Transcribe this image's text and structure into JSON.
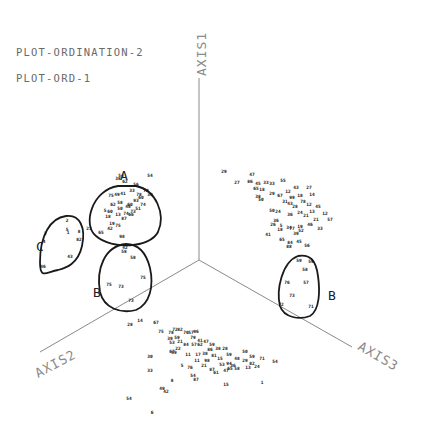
{
  "titles": {
    "line1": "PLOT-ORDINATION-2",
    "line2": "PLOT-ORD-1"
  },
  "axes": {
    "origin": [
      199,
      260
    ],
    "axis1": {
      "label": "AXIS1",
      "end": [
        199,
        78
      ]
    },
    "axis2": {
      "label": "AXIS2",
      "end": [
        40,
        352
      ]
    },
    "axis3": {
      "label": "AXIS3",
      "end": [
        352,
        347
      ]
    }
  },
  "clusters": [
    {
      "id": "A",
      "label": "A",
      "label_pos": [
        120,
        180
      ],
      "shape": "M118,186 C92,190 82,225 96,236 C112,250 150,248 158,232 C166,214 156,190 136,186 Z"
    },
    {
      "id": "B-left",
      "label": "B",
      "label_pos": [
        93,
        297
      ],
      "shape": "M126,244 C104,246 96,270 100,292 C104,308 120,314 136,310 C150,304 154,286 150,268 C146,252 138,244 126,244 Z"
    },
    {
      "id": "C",
      "label": "C",
      "label_pos": [
        36,
        251
      ],
      "shape": "M66,216 C50,218 40,236 40,262 C40,280 46,272 58,270 C66,268 78,264 82,246 C86,228 80,214 66,216 Z"
    },
    {
      "id": "B-right",
      "label": "B",
      "label_pos": [
        328,
        300
      ],
      "shape": "M298,256 C282,262 276,290 280,306 C284,318 300,320 310,316 C320,310 320,290 318,276 C316,260 310,254 298,256 Z"
    }
  ],
  "point_groups": [
    {
      "name": "axis1-axis2-plane",
      "points": [
        [
          121,
          177,
          "54"
        ],
        [
          136,
          186,
          "56"
        ],
        [
          150,
          177,
          "54"
        ],
        [
          111,
          197,
          "75"
        ],
        [
          117,
          196,
          "49"
        ],
        [
          123,
          195,
          "41"
        ],
        [
          120,
          204,
          "58"
        ],
        [
          130,
          206,
          "60"
        ],
        [
          141,
          199,
          "60"
        ],
        [
          143,
          206,
          "74"
        ],
        [
          133,
          213,
          "73"
        ],
        [
          124,
          220,
          "87"
        ],
        [
          105,
          212,
          "5"
        ],
        [
          110,
          213,
          "60"
        ],
        [
          118,
          216,
          "13"
        ],
        [
          126,
          215,
          "74"
        ],
        [
          138,
          210,
          "51"
        ],
        [
          118,
          180,
          "38"
        ],
        [
          125,
          183,
          "62"
        ],
        [
          132,
          192,
          "33"
        ],
        [
          139,
          196,
          "78"
        ],
        [
          146,
          192,
          "70"
        ],
        [
          136,
          202,
          "93"
        ],
        [
          128,
          208,
          "48"
        ],
        [
          113,
          206,
          "62"
        ],
        [
          120,
          210,
          "50"
        ],
        [
          131,
          216,
          "66"
        ],
        [
          108,
          218,
          "18"
        ],
        [
          150,
          196,
          "39"
        ],
        [
          67,
          222,
          "2"
        ],
        [
          67,
          231,
          "5"
        ],
        [
          68,
          234,
          "1"
        ],
        [
          79,
          233,
          "8"
        ],
        [
          79,
          241,
          "82"
        ],
        [
          45,
          235,
          "3"
        ],
        [
          44,
          243,
          "4"
        ],
        [
          70,
          258,
          "43"
        ],
        [
          43,
          268,
          "46"
        ],
        [
          89,
          230,
          "23"
        ],
        [
          112,
          225,
          "19"
        ],
        [
          118,
          227,
          "75"
        ],
        [
          110,
          230,
          "42"
        ],
        [
          101,
          234,
          "65"
        ],
        [
          122,
          238,
          "98"
        ],
        [
          125,
          249,
          "42"
        ],
        [
          124,
          253,
          "58"
        ],
        [
          133,
          259,
          "58"
        ],
        [
          143,
          279,
          "75"
        ],
        [
          109,
          286,
          "75"
        ],
        [
          121,
          288,
          "73"
        ],
        [
          131,
          302,
          "73"
        ]
      ]
    },
    {
      "name": "axis1-axis3-plane",
      "points": [
        [
          224,
          173,
          "29"
        ],
        [
          252,
          176,
          "47"
        ],
        [
          237,
          184,
          "27"
        ],
        [
          250,
          183,
          "86"
        ],
        [
          258,
          185,
          "45"
        ],
        [
          266,
          184,
          "33"
        ],
        [
          272,
          185,
          "33"
        ],
        [
          283,
          182,
          "55"
        ],
        [
          256,
          190,
          "65"
        ],
        [
          262,
          191,
          "18"
        ],
        [
          258,
          198,
          "38"
        ],
        [
          272,
          195,
          "29"
        ],
        [
          280,
          197,
          "67"
        ],
        [
          288,
          193,
          "12"
        ],
        [
          296,
          189,
          "43"
        ],
        [
          292,
          199,
          "99"
        ],
        [
          300,
          197,
          "18"
        ],
        [
          309,
          189,
          "27"
        ],
        [
          312,
          196,
          "14"
        ],
        [
          285,
          203,
          "31"
        ],
        [
          290,
          205,
          "43"
        ],
        [
          295,
          208,
          "28"
        ],
        [
          303,
          203,
          "78"
        ],
        [
          309,
          206,
          "12"
        ],
        [
          318,
          208,
          "45"
        ],
        [
          312,
          213,
          "13"
        ],
        [
          261,
          201,
          "50"
        ],
        [
          272,
          212,
          "50"
        ],
        [
          278,
          213,
          "24"
        ],
        [
          290,
          216,
          "36"
        ],
        [
          300,
          214,
          "24"
        ],
        [
          306,
          217,
          "21"
        ],
        [
          316,
          221,
          "21"
        ],
        [
          325,
          215,
          "12"
        ],
        [
          330,
          221,
          "57"
        ],
        [
          310,
          226,
          "46"
        ],
        [
          320,
          230,
          "33"
        ],
        [
          273,
          226,
          "26"
        ],
        [
          280,
          231,
          "18"
        ],
        [
          289,
          229,
          "34"
        ],
        [
          300,
          228,
          "19"
        ],
        [
          276,
          222,
          "36"
        ],
        [
          281,
          227,
          "5"
        ],
        [
          292,
          230,
          "77"
        ],
        [
          296,
          235,
          "39"
        ],
        [
          301,
          232,
          "52"
        ],
        [
          268,
          236,
          "41"
        ],
        [
          282,
          241,
          "65"
        ],
        [
          299,
          243,
          "45"
        ],
        [
          307,
          247,
          "56"
        ],
        [
          289,
          248,
          "88"
        ],
        [
          290,
          244,
          "84"
        ],
        [
          299,
          262,
          "59"
        ],
        [
          311,
          263,
          "59"
        ],
        [
          305,
          271,
          "58"
        ],
        [
          287,
          284,
          "76"
        ],
        [
          306,
          284,
          "57"
        ],
        [
          292,
          297,
          "73"
        ],
        [
          281,
          306,
          "72"
        ],
        [
          311,
          308,
          "71"
        ]
      ]
    },
    {
      "name": "axis2-axis3-plane",
      "points": [
        [
          130,
          326,
          "28"
        ],
        [
          156,
          324,
          "67"
        ],
        [
          161,
          333,
          "75"
        ],
        [
          171,
          334,
          "78"
        ],
        [
          175,
          331,
          "72"
        ],
        [
          180,
          331,
          "82"
        ],
        [
          186,
          334,
          "70"
        ],
        [
          191,
          334,
          "57"
        ],
        [
          196,
          333,
          "96"
        ],
        [
          170,
          340,
          "39"
        ],
        [
          177,
          339,
          "59"
        ],
        [
          180,
          343,
          "21"
        ],
        [
          193,
          339,
          "79"
        ],
        [
          200,
          342,
          "41"
        ],
        [
          172,
          344,
          "53"
        ],
        [
          186,
          346,
          "84"
        ],
        [
          194,
          346,
          "57"
        ],
        [
          200,
          346,
          "62"
        ],
        [
          206,
          343,
          "47"
        ],
        [
          212,
          346,
          "59"
        ],
        [
          210,
          351,
          "86"
        ],
        [
          218,
          350,
          "38"
        ],
        [
          225,
          350,
          "28"
        ],
        [
          174,
          354,
          "59"
        ],
        [
          178,
          350,
          "22"
        ],
        [
          188,
          356,
          "11"
        ],
        [
          198,
          356,
          "17"
        ],
        [
          205,
          355,
          "38"
        ],
        [
          214,
          357,
          "81"
        ],
        [
          220,
          360,
          "15"
        ],
        [
          229,
          356,
          "59"
        ],
        [
          237,
          360,
          "48"
        ],
        [
          197,
          362,
          "11"
        ],
        [
          207,
          362,
          "98"
        ],
        [
          222,
          366,
          "53"
        ],
        [
          229,
          365,
          "94"
        ],
        [
          233,
          367,
          "36"
        ],
        [
          245,
          362,
          "29"
        ],
        [
          252,
          365,
          "82"
        ],
        [
          245,
          353,
          "50"
        ],
        [
          252,
          358,
          "59"
        ],
        [
          190,
          369,
          "76"
        ],
        [
          204,
          367,
          "21"
        ],
        [
          212,
          371,
          "87"
        ],
        [
          216,
          374,
          "61"
        ],
        [
          226,
          372,
          "47"
        ],
        [
          230,
          370,
          "65"
        ],
        [
          237,
          370,
          "58"
        ],
        [
          248,
          369,
          "13"
        ],
        [
          257,
          368,
          "24"
        ],
        [
          262,
          360,
          "71"
        ],
        [
          275,
          363,
          "54"
        ],
        [
          172,
          353,
          "67"
        ],
        [
          150,
          358,
          "30"
        ],
        [
          182,
          367,
          "5"
        ],
        [
          193,
          377,
          "54"
        ],
        [
          196,
          381,
          "87"
        ],
        [
          226,
          386,
          "15"
        ],
        [
          150,
          372,
          "33"
        ],
        [
          172,
          382,
          "8"
        ],
        [
          162,
          390,
          "49"
        ],
        [
          166,
          393,
          "42"
        ],
        [
          262,
          384,
          "1"
        ],
        [
          129,
          400,
          "54"
        ],
        [
          152,
          414,
          "6"
        ],
        [
          140,
          322,
          "14"
        ]
      ]
    }
  ]
}
